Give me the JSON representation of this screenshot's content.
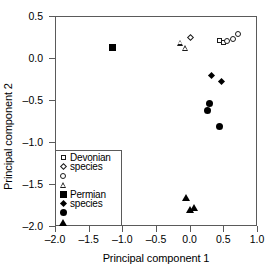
{
  "chart_data": {
    "type": "scatter",
    "title": "",
    "xlabel": "Principal component 1",
    "ylabel": "Principal component 2",
    "xlim": [
      -2.0,
      1.0
    ],
    "ylim": [
      -2.0,
      0.5
    ],
    "xticks": [
      "-2.0",
      "-1.5",
      "-1.0",
      "-0.5",
      "0.0",
      "0.5",
      "1.0"
    ],
    "xtick_values": [
      -2.0,
      -1.5,
      -1.0,
      -0.5,
      0.0,
      0.5,
      1.0
    ],
    "yticks": [
      "0.5",
      "0.0",
      "-0.5",
      "-1.0",
      "-1.5",
      "-2.0"
    ],
    "ytick_values": [
      0.5,
      0.0,
      -0.5,
      -1.0,
      -1.5,
      -2.0
    ],
    "grid": false,
    "legend_position": "lower left",
    "series": [
      {
        "name": "Devonian species (square)",
        "marker": "square-open",
        "group": "Devonian",
        "points": [
          {
            "x": 0.45,
            "y": 0.21
          },
          {
            "x": 0.5,
            "y": 0.19
          }
        ]
      },
      {
        "name": "Devonian species (diamond)",
        "marker": "diamond-open",
        "group": "Devonian",
        "points": [
          {
            "x": 0.01,
            "y": 0.25
          }
        ]
      },
      {
        "name": "Devonian species (circle)",
        "marker": "circle-open",
        "group": "Devonian",
        "points": [
          {
            "x": 0.56,
            "y": 0.2
          },
          {
            "x": 0.65,
            "y": 0.23
          },
          {
            "x": 0.72,
            "y": 0.28
          }
        ]
      },
      {
        "name": "Devonian species (triangle)",
        "marker": "triangle-open",
        "group": "Devonian",
        "points": [
          {
            "x": -0.14,
            "y": 0.18
          },
          {
            "x": -0.06,
            "y": 0.19
          }
        ]
      },
      {
        "name": "Permian species (square)",
        "marker": "square-fill",
        "group": "Permian",
        "points": [
          {
            "x": -1.15,
            "y": 0.12
          }
        ]
      },
      {
        "name": "Permian species (diamond)",
        "marker": "diamond-fill",
        "group": "Permian",
        "points": [
          {
            "x": 0.33,
            "y": -0.21
          },
          {
            "x": 0.48,
            "y": -0.28
          }
        ]
      },
      {
        "name": "Permian species (circle)",
        "marker": "circle-fill",
        "group": "Permian",
        "points": [
          {
            "x": 0.3,
            "y": -0.54
          },
          {
            "x": 0.27,
            "y": -0.62
          },
          {
            "x": 0.44,
            "y": -0.81
          }
        ]
      },
      {
        "name": "Permian species (triangle)",
        "marker": "triangle-fill",
        "group": "Permian",
        "points": [
          {
            "x": -0.05,
            "y": -1.66
          },
          {
            "x": 0.0,
            "y": -1.8
          },
          {
            "x": 0.06,
            "y": -1.78
          }
        ]
      }
    ],
    "legend": [
      {
        "marker": "square-open",
        "label": "Devonian"
      },
      {
        "marker": "diamond-open",
        "label": "species"
      },
      {
        "marker": "circle-open",
        "label": ""
      },
      {
        "marker": "triangle-open",
        "label": ""
      },
      {
        "marker": "square-fill",
        "label": "Permian"
      },
      {
        "marker": "diamond-fill",
        "label": "species"
      },
      {
        "marker": "circle-fill",
        "label": ""
      },
      {
        "marker": "triangle-fill",
        "label": ""
      }
    ],
    "colors": {
      "marker_fill": "#000000",
      "marker_edge": "#1a1a1a",
      "axis": "#5a5a5a",
      "text": "#000000",
      "background": "#ffffff"
    }
  }
}
